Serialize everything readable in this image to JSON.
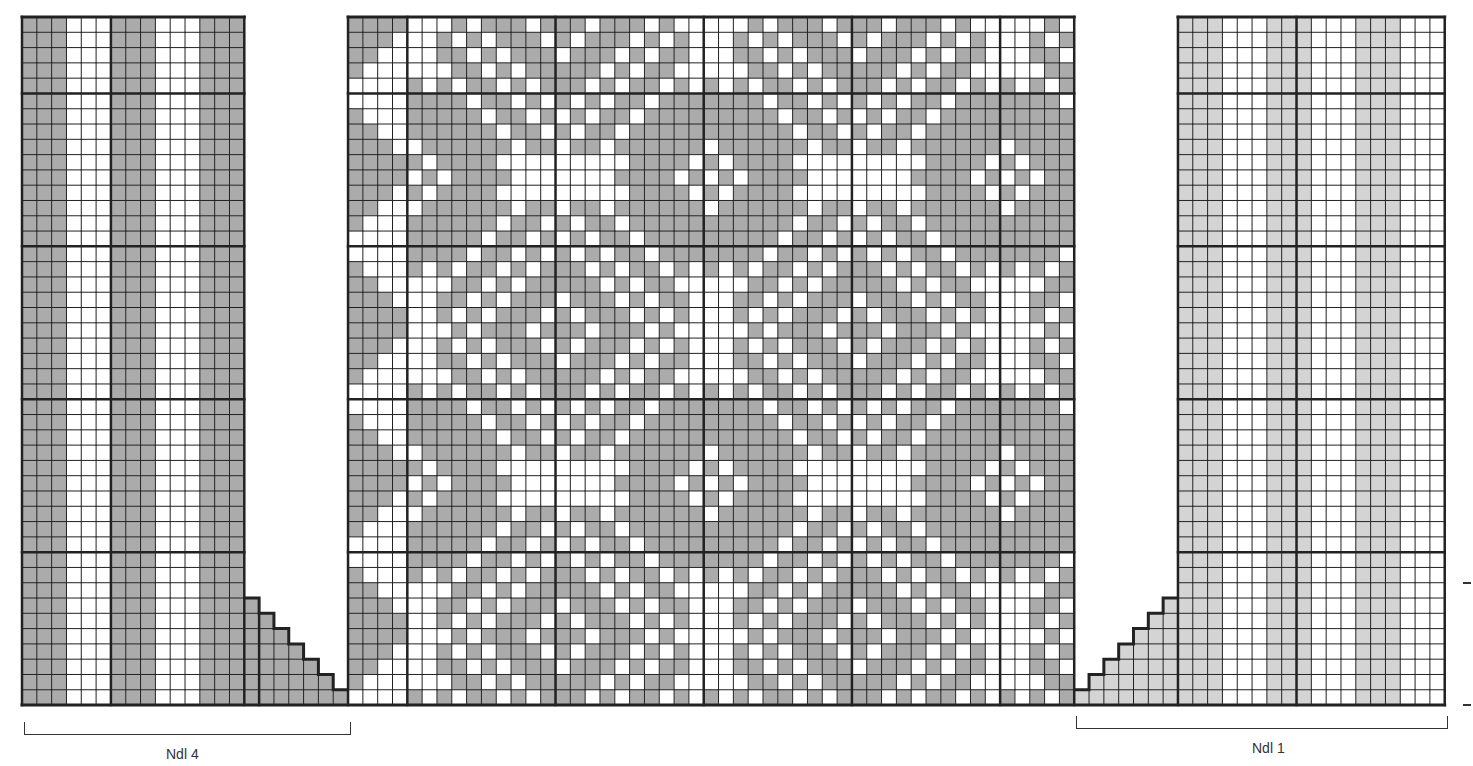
{
  "chart_data": {
    "type": "knitting-chart",
    "title": "",
    "grid": {
      "origin_x": 22,
      "origin_y": 17,
      "cell_w": 14.82,
      "cell_h": 15.29,
      "cols": 96,
      "rows": 45,
      "bold_rows": [
        5,
        15,
        25,
        35
      ],
      "colors": {
        "dark": "#ababab",
        "light": "#d4d4d4",
        "white": "#ffffff",
        "line": "#222222"
      }
    },
    "panels": [
      {
        "id": "left",
        "col_start": 0,
        "col_end": 15,
        "shade": "dark",
        "bold_cols": [
          0,
          6,
          15
        ],
        "column_pattern": "GGGWWWGGGWWWGGG"
      },
      {
        "id": "left-decrease",
        "col_start": 15,
        "col_end": 22,
        "shade": "dark",
        "bold_cols": [
          16
        ],
        "stair_top_rows": [
          38,
          39,
          40,
          41,
          42,
          43,
          44
        ],
        "column_pattern": "GGGGGGG"
      },
      {
        "id": "center",
        "col_start": 22,
        "col_end": 71,
        "shade": "dark",
        "bold_cols": [
          22,
          26,
          36,
          46,
          56,
          66,
          71
        ]
      },
      {
        "id": "right-increase",
        "col_start": 71,
        "col_end": 78,
        "shade": "light",
        "bold_cols": [],
        "stair_top_rows": [
          44,
          43,
          42,
          41,
          40,
          39,
          38
        ],
        "column_pattern": "GGGGGGG"
      },
      {
        "id": "right",
        "col_start": 78,
        "col_end": 96,
        "shade": "light",
        "bold_cols": [
          78,
          86,
          96
        ],
        "column_pattern": "GGGWWWGGGWWWGGGWWW"
      }
    ],
    "labels": [
      {
        "text": "Ndl 4",
        "bracket_from_col": 0,
        "bracket_to_col": 22
      },
      {
        "text": "Ndl 1",
        "bracket_from_col": 71,
        "bracket_to_col": 96
      }
    ]
  },
  "labels": {
    "needle_left": "Ndl 4",
    "needle_right": "Ndl 1"
  }
}
